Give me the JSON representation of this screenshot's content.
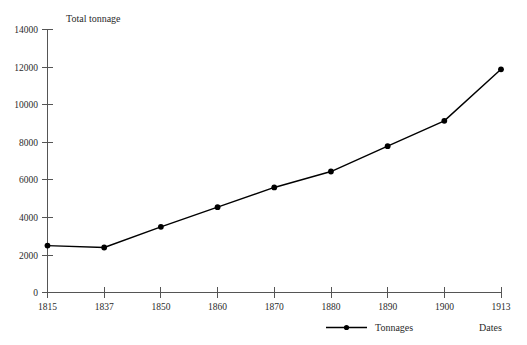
{
  "chart_data": {
    "type": "line",
    "title": "",
    "ylabel": "Total tonnage",
    "xlabel": "Dates",
    "categories": [
      "1815",
      "1837",
      "1850",
      "1860",
      "1870",
      "1880",
      "1890",
      "1900",
      "1913"
    ],
    "x": [
      1815,
      1837,
      1850,
      1860,
      1870,
      1880,
      1890,
      1900,
      1913
    ],
    "series": [
      {
        "name": "Tonnages",
        "values": [
          2500,
          2400,
          3500,
          4550,
          5600,
          6450,
          7800,
          9150,
          11900
        ],
        "color": "#000000",
        "marker": "circle"
      }
    ],
    "ylim": [
      0,
      14000
    ],
    "yticks": [
      0,
      2000,
      4000,
      6000,
      8000,
      10000,
      12000,
      14000
    ],
    "ytick_labels": [
      "0",
      "2000",
      "4000",
      "6000",
      "8000",
      "10000",
      "12000",
      "14000"
    ],
    "xtick_labels": [
      "1815",
      "1837",
      "1850",
      "1860",
      "1870",
      "1880",
      "1890",
      "1900",
      "1913"
    ],
    "grid": false,
    "legend_position": "bottom-center",
    "legend_entries": [
      "Tonnages"
    ]
  },
  "axes": {
    "y_axis_title": "Total tonnage",
    "x_axis_title": "Dates"
  },
  "legend": {
    "entries": [
      {
        "label": "Tonnages",
        "color": "#000000"
      }
    ]
  },
  "colors": {
    "series": "#000000",
    "axis": "#555555",
    "text": "#2b2b2b",
    "background": "#ffffff"
  }
}
